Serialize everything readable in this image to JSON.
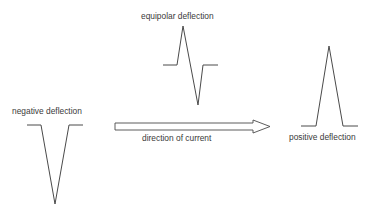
{
  "labels": {
    "equipolar": "equipolar deflection",
    "negative": "negative deflection",
    "direction": "direction of current",
    "positive": "positive deflection"
  },
  "colors": {
    "stroke": "#4a4a4a",
    "text": "#3a3a3a",
    "background": "#ffffff"
  }
}
